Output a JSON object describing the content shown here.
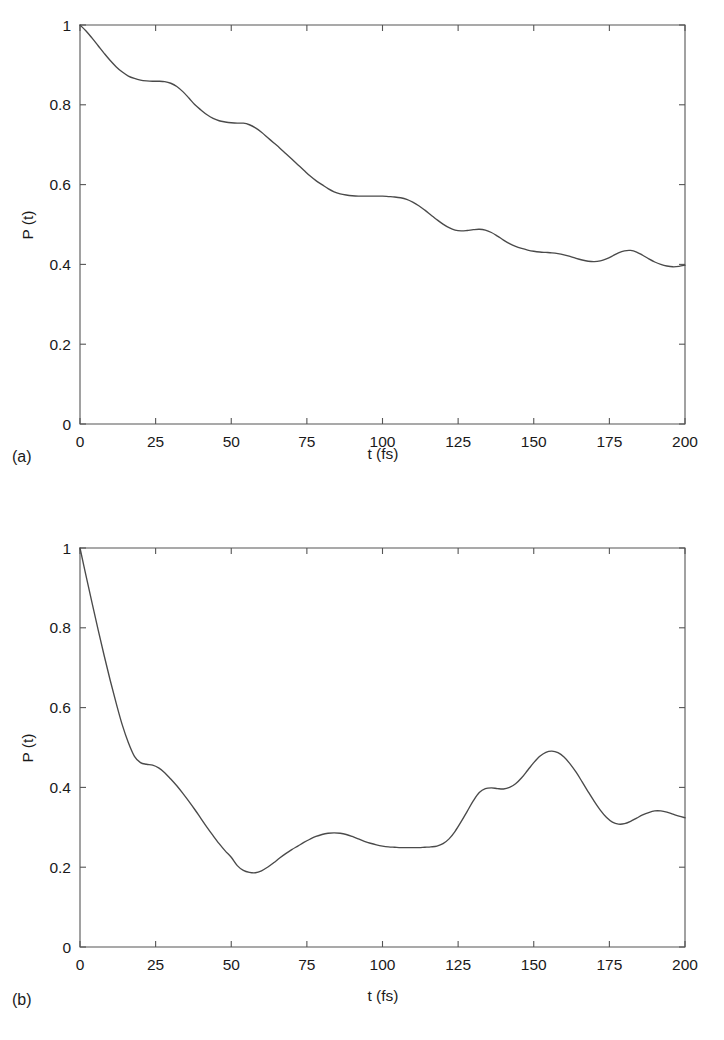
{
  "figure": {
    "panel_count": 2,
    "background_color": "#ffffff",
    "curve_color": "#4a4a4a",
    "axis_color": "#555555"
  },
  "panels": [
    {
      "tag": "(a)",
      "xlabel": "t (fs)",
      "ylabel": "P (t)",
      "xticklabels": [
        "0",
        "25",
        "50",
        "75",
        "100",
        "125",
        "150",
        "175",
        "200"
      ],
      "yticklabels": [
        "0",
        "0.2",
        "0.4",
        "0.6",
        "0.8",
        "1"
      ]
    },
    {
      "tag": "(b)",
      "xlabel": "t (fs)",
      "ylabel": "P (t)",
      "xticklabels": [
        "0",
        "25",
        "50",
        "75",
        "100",
        "125",
        "150",
        "175",
        "200"
      ],
      "yticklabels": [
        "0",
        "0.2",
        "0.4",
        "0.6",
        "0.8",
        "1"
      ]
    }
  ],
  "chart_data": [
    {
      "type": "line",
      "panel": "(a)",
      "title": "",
      "xlabel": "t (fs)",
      "ylabel": "P (t)",
      "xlim": [
        0,
        200
      ],
      "ylim": [
        0,
        1
      ],
      "xticks": [
        0,
        25,
        50,
        75,
        100,
        125,
        150,
        175,
        200
      ],
      "yticks": [
        0,
        0.2,
        0.4,
        0.6,
        0.8,
        1
      ],
      "grid": false,
      "legend": null,
      "series": [
        {
          "name": "P(t)",
          "x": [
            0,
            2,
            4,
            6,
            8,
            10,
            12,
            14,
            16,
            18,
            20,
            22,
            24,
            26,
            28,
            30,
            32,
            34,
            36,
            38,
            40,
            42,
            44,
            46,
            48,
            50,
            52,
            54,
            56,
            58,
            60,
            62,
            64,
            66,
            68,
            70,
            72,
            74,
            76,
            78,
            80,
            82,
            84,
            86,
            88,
            90,
            92,
            94,
            96,
            98,
            100,
            102,
            104,
            106,
            108,
            110,
            112,
            114,
            116,
            118,
            120,
            122,
            124,
            126,
            128,
            130,
            132,
            134,
            136,
            138,
            140,
            142,
            144,
            146,
            148,
            150,
            152,
            154,
            156,
            158,
            160,
            162,
            164,
            166,
            168,
            170,
            172,
            174,
            176,
            178,
            180,
            182,
            184,
            186,
            188,
            190,
            192,
            194,
            196,
            198,
            200
          ],
          "y": [
            1.0,
            0.985,
            0.967,
            0.948,
            0.929,
            0.911,
            0.895,
            0.882,
            0.872,
            0.866,
            0.862,
            0.86,
            0.859,
            0.859,
            0.858,
            0.854,
            0.846,
            0.833,
            0.817,
            0.8,
            0.787,
            0.775,
            0.766,
            0.76,
            0.757,
            0.755,
            0.754,
            0.754,
            0.75,
            0.742,
            0.731,
            0.718,
            0.705,
            0.692,
            0.678,
            0.664,
            0.65,
            0.636,
            0.622,
            0.61,
            0.6,
            0.59,
            0.582,
            0.577,
            0.574,
            0.572,
            0.571,
            0.571,
            0.571,
            0.571,
            0.571,
            0.57,
            0.569,
            0.567,
            0.563,
            0.556,
            0.547,
            0.536,
            0.524,
            0.512,
            0.501,
            0.492,
            0.486,
            0.484,
            0.485,
            0.487,
            0.488,
            0.486,
            0.48,
            0.471,
            0.461,
            0.452,
            0.445,
            0.44,
            0.436,
            0.433,
            0.431,
            0.43,
            0.429,
            0.427,
            0.424,
            0.42,
            0.415,
            0.411,
            0.408,
            0.407,
            0.409,
            0.414,
            0.421,
            0.429,
            0.434,
            0.435,
            0.431,
            0.423,
            0.414,
            0.406,
            0.4,
            0.396,
            0.394,
            0.395,
            0.398
          ]
        }
      ]
    },
    {
      "type": "line",
      "panel": "(b)",
      "title": "",
      "xlabel": "t (fs)",
      "ylabel": "P (t)",
      "xlim": [
        0,
        200
      ],
      "ylim": [
        0,
        1
      ],
      "xticks": [
        0,
        25,
        50,
        75,
        100,
        125,
        150,
        175,
        200
      ],
      "yticks": [
        0,
        0.2,
        0.4,
        0.6,
        0.8,
        1
      ],
      "grid": false,
      "legend": null,
      "series": [
        {
          "name": "P(t)",
          "x": [
            0,
            2,
            4,
            6,
            8,
            10,
            12,
            14,
            16,
            18,
            20,
            22,
            24,
            26,
            28,
            30,
            32,
            34,
            36,
            38,
            40,
            42,
            44,
            46,
            48,
            50,
            52,
            54,
            56,
            58,
            60,
            62,
            64,
            66,
            68,
            70,
            72,
            74,
            76,
            78,
            80,
            82,
            84,
            86,
            88,
            90,
            92,
            94,
            96,
            98,
            100,
            102,
            104,
            106,
            108,
            110,
            112,
            114,
            116,
            118,
            120,
            122,
            124,
            126,
            128,
            130,
            132,
            134,
            136,
            138,
            140,
            142,
            144,
            146,
            148,
            150,
            152,
            154,
            156,
            158,
            160,
            162,
            164,
            166,
            168,
            170,
            172,
            174,
            176,
            178,
            180,
            182,
            184,
            186,
            188,
            190,
            192,
            194,
            196,
            198,
            200
          ],
          "y": [
            1.0,
            0.93,
            0.862,
            0.795,
            0.73,
            0.668,
            0.61,
            0.556,
            0.512,
            0.478,
            0.462,
            0.458,
            0.456,
            0.449,
            0.437,
            0.421,
            0.404,
            0.385,
            0.365,
            0.344,
            0.322,
            0.3,
            0.279,
            0.259,
            0.241,
            0.225,
            0.204,
            0.192,
            0.187,
            0.186,
            0.191,
            0.2,
            0.211,
            0.223,
            0.234,
            0.244,
            0.253,
            0.262,
            0.27,
            0.277,
            0.282,
            0.285,
            0.286,
            0.285,
            0.282,
            0.277,
            0.271,
            0.265,
            0.26,
            0.256,
            0.253,
            0.251,
            0.25,
            0.249,
            0.249,
            0.249,
            0.249,
            0.25,
            0.251,
            0.253,
            0.259,
            0.271,
            0.29,
            0.314,
            0.34,
            0.366,
            0.387,
            0.397,
            0.399,
            0.397,
            0.396,
            0.4,
            0.409,
            0.424,
            0.443,
            0.462,
            0.478,
            0.488,
            0.491,
            0.487,
            0.476,
            0.459,
            0.438,
            0.414,
            0.389,
            0.365,
            0.343,
            0.325,
            0.313,
            0.308,
            0.309,
            0.315,
            0.323,
            0.331,
            0.337,
            0.341,
            0.341,
            0.338,
            0.333,
            0.328,
            0.324
          ]
        }
      ]
    }
  ]
}
